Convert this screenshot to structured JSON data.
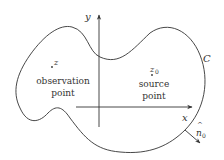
{
  "diagram": {
    "curve_label": "C",
    "axes": {
      "x_label": "x",
      "y_label": "y"
    },
    "observation": {
      "symbol": "z",
      "label_line1": "observation",
      "label_line2": "point"
    },
    "source": {
      "symbol": "z",
      "subscript": "0",
      "label_line1": "source",
      "label_line2": "point"
    },
    "normal": {
      "symbol": "n",
      "subscript": "0",
      "hat": "^"
    },
    "colors": {
      "stroke": "#333333",
      "background": "#ffffff"
    }
  }
}
